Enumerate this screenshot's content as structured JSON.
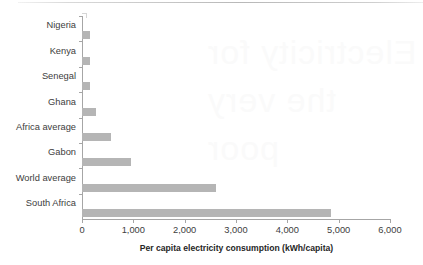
{
  "chart_data": {
    "type": "bar",
    "orientation": "horizontal",
    "title": "",
    "subtitle": "",
    "xlabel": "Per capita electricity consumption  (kWh/capita)",
    "ylabel": "",
    "categories": [
      "Nigeria",
      "Kenya",
      "Senegal",
      "Ghana",
      "Africa average",
      "Gabon",
      "World average",
      "South Africa"
    ],
    "values": [
      155,
      160,
      160,
      275,
      565,
      955,
      2610,
      4850
    ],
    "xlim": [
      0,
      6000
    ],
    "xticks": [
      0,
      1000,
      2000,
      3000,
      4000,
      5000,
      6000
    ],
    "xtick_labels": [
      "0",
      "1,000",
      "2,000",
      "3,000",
      "4,000",
      "5,000",
      "6,000"
    ],
    "grid": false,
    "legend": null,
    "bar_color": "#b5b5b5",
    "axis_color": "#a6a6a6",
    "text_color": "#3d3d3d"
  },
  "artifacts": {
    "bleed_through_text": "Electricity\nfor the very\npoor"
  }
}
